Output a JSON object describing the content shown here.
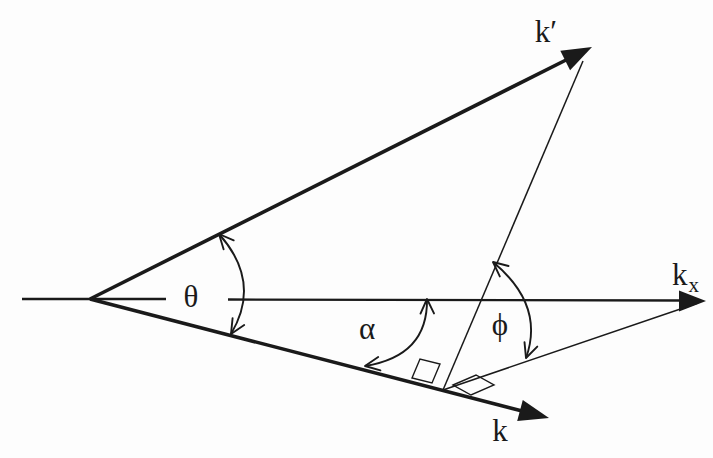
{
  "figure": {
    "kind": "scattering-geometry-diagram",
    "background_color": "#fdfdfd",
    "ink_color": "#1a1a1a",
    "labels": {
      "k_prime": "k′",
      "k": "k",
      "kx_base": "k",
      "kx_sub": "x",
      "theta": "θ",
      "alpha": "α",
      "phi": "ϕ"
    },
    "vectors": [
      {
        "name": "k-prime",
        "label": "k′",
        "style": "thick-arrow",
        "direction": "up-right"
      },
      {
        "name": "k",
        "label": "k",
        "style": "thick-arrow",
        "direction": "down-right"
      },
      {
        "name": "k-x-axis",
        "label": "kx",
        "style": "axis-arrow",
        "direction": "right"
      }
    ],
    "angles": [
      {
        "name": "theta",
        "label": "θ",
        "between": [
          "k-prime",
          "k"
        ],
        "arrow_ends": 2
      },
      {
        "name": "alpha",
        "label": "α",
        "between": [
          "k-x-axis",
          "k"
        ],
        "arrow_ends": 2
      },
      {
        "name": "phi",
        "label": "ϕ",
        "between": [
          "perpendicular-to-k",
          "projection-line"
        ],
        "arrow_ends": 2
      }
    ],
    "construction_lines": [
      {
        "name": "perpendicular-line",
        "from": "k-prime-tip",
        "to": "foot-on-k"
      },
      {
        "name": "projection-line",
        "from": "foot-on-k",
        "to": "k-x-arrow-tip"
      }
    ],
    "right_angle_marks": 2
  }
}
